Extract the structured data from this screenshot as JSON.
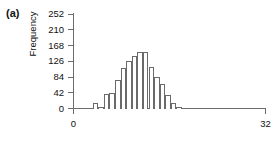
{
  "figure": {
    "panel_label": "(a)"
  },
  "chart_data": {
    "type": "bar",
    "title": "",
    "subtitle": "",
    "xlabel": "",
    "ylabel": "Frequency",
    "xlim": [
      0,
      32
    ],
    "ylim": [
      0,
      252
    ],
    "grid": false,
    "legend": null,
    "y_ticks": [
      {
        "value": 252,
        "label": "252"
      },
      {
        "value": 210,
        "label": "210"
      },
      {
        "value": 168,
        "label": "168"
      },
      {
        "value": 126,
        "label": "126"
      },
      {
        "value": 84,
        "label": "84"
      },
      {
        "value": 42,
        "label": "42"
      },
      {
        "value": 0,
        "label": "0"
      }
    ],
    "x_ticks": [
      {
        "value": 0,
        "label": "0"
      },
      {
        "value": 32,
        "label": "32"
      }
    ],
    "bin_width": 0.93,
    "bin_starts": [
      3.2,
      4.13,
      5.06,
      5.99,
      6.92,
      7.85,
      8.78,
      9.71,
      10.64,
      11.57,
      12.5,
      13.43,
      14.36,
      15.29,
      16.22,
      17.15
    ],
    "categories": [
      "3.2",
      "4.1",
      "5.1",
      "6.0",
      "6.9",
      "7.9",
      "8.8",
      "9.7",
      "10.6",
      "11.6",
      "12.5",
      "13.4",
      "14.4",
      "15.3",
      "16.2",
      "17.2"
    ],
    "values": [
      14,
      5,
      40,
      42,
      75,
      108,
      128,
      140,
      150,
      150,
      112,
      84,
      66,
      36,
      14,
      5
    ],
    "bar_facecolor": "#ffffff",
    "bar_edgecolor": "#6a6a6a",
    "axis_color": "#6d6d6d",
    "text_color": "#111111"
  }
}
